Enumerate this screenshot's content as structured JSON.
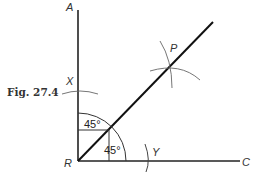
{
  "figure": {
    "caption": "Fig. 27.4",
    "points": {
      "A": "A",
      "B": "R",
      "C": "C",
      "X": "X",
      "Y": "Y",
      "P": "P"
    },
    "angles": {
      "upper": "45°",
      "lower": "45°"
    },
    "colors": {
      "line": "#222222",
      "arc": "#555555",
      "text": "#333333"
    }
  }
}
